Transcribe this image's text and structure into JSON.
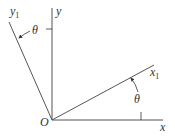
{
  "diagram": {
    "colors": {
      "line": "#555555",
      "text": "#333333",
      "background": "#ffffff"
    },
    "origin": {
      "label": "O",
      "x": 52,
      "y": 120
    },
    "axes": [
      {
        "id": "x",
        "label": "x",
        "subscript": "",
        "end": [
          163,
          120
        ]
      },
      {
        "id": "y",
        "label": "y",
        "subscript": "",
        "end": [
          52,
          8
        ]
      },
      {
        "id": "x1",
        "label": "x",
        "subscript": "1",
        "end": [
          154,
          65
        ]
      },
      {
        "id": "y1",
        "label": "y",
        "subscript": "1",
        "end": [
          9,
          22
        ]
      }
    ],
    "angles": [
      {
        "id": "theta-top",
        "label": "θ",
        "between": [
          "y",
          "y1"
        ]
      },
      {
        "id": "theta-bottom",
        "label": "θ",
        "between": [
          "x",
          "x1"
        ]
      }
    ]
  }
}
